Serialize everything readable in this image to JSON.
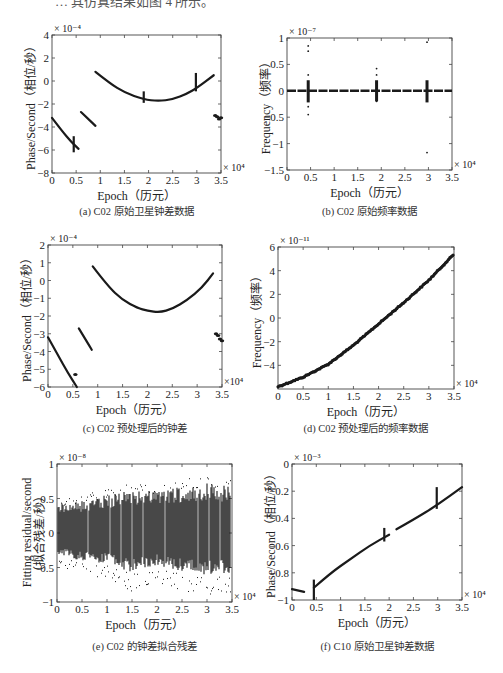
{
  "page": {
    "top_cut_text": "… 其仿真结果如图 4 所示。"
  },
  "panels": [
    {
      "id": "a",
      "caption": "(a) C02 原始卫星钟差数据",
      "xlabel": "Epoch（历元）",
      "ylabel": "Phase/Second（相位/秒）",
      "y_exponent": "× 10⁻⁴",
      "x_exponent": "× 10⁴"
    },
    {
      "id": "b",
      "caption": "(b) C02 原始频率数据",
      "xlabel": "Epoch（历元）",
      "ylabel": "Frequency（频率）",
      "y_exponent": "× 10⁻⁷",
      "x_exponent": "× 10⁴"
    },
    {
      "id": "c",
      "caption": "(c) C02 预处理后的钟差",
      "xlabel": "Epoch（历元）",
      "ylabel": "Phase/Second（相位/秒）",
      "y_exponent": "× 10⁻⁴",
      "x_exponent": "×10⁴"
    },
    {
      "id": "d",
      "caption": "(d) C02 预处理后的频率数据",
      "xlabel": "Epoch（历元）",
      "ylabel": "Frequency（频率）",
      "y_exponent": "× 10⁻¹¹",
      "x_exponent": "× 10⁴"
    },
    {
      "id": "e",
      "caption": "(e) C02 的钟差拟合残差",
      "xlabel": "Epoch（历元）",
      "ylabel": "Fitting residual/second",
      "ylabel2": "（拟合残差/秒）",
      "y_exponent": "× 10⁻⁸",
      "x_exponent": "× 10⁴"
    },
    {
      "id": "f",
      "caption": "(f) C10 原始卫星钟差数据",
      "xlabel": "Epoch（历元）",
      "ylabel": "Phase/Second（相位/秒）",
      "y_exponent": "× 10⁻³",
      "x_exponent": "× 10⁴"
    }
  ],
  "chart_data": [
    {
      "id": "a",
      "type": "scatter",
      "title": "(a) C02 原始卫星钟差数据",
      "xlabel": "Epoch（历元）",
      "ylabel": "Phase/Second（相位/秒）",
      "x_scale": "× 10^4",
      "y_scale": "× 10^-4",
      "xlim": [
        0,
        3.5
      ],
      "ylim": [
        -8,
        4
      ],
      "xticks": [
        "0",
        "0.5",
        "1",
        "1.5",
        "2",
        "2.5",
        "3",
        "3.5"
      ],
      "yticks": [
        "-8",
        "-6",
        "-4",
        "-2",
        "0",
        "2",
        "4"
      ],
      "grid": false,
      "legend": null,
      "series": [
        {
          "name": "segment1",
          "x": [
            0,
            0.2,
            0.4,
            0.55
          ],
          "y": [
            -3.2,
            -4.3,
            -5.3,
            -5.9
          ]
        },
        {
          "name": "segment2",
          "x": [
            0.6,
            0.75,
            0.9
          ],
          "y": [
            -2.7,
            -3.3,
            -3.9
          ]
        },
        {
          "name": "segment3",
          "x": [
            0.9,
            1.2,
            1.5,
            1.9,
            2.2,
            2.5,
            2.8,
            3.0,
            3.35
          ],
          "y": [
            0.8,
            -0.2,
            -1.0,
            -1.6,
            -1.75,
            -1.6,
            -1.1,
            -0.6,
            0.5
          ]
        },
        {
          "name": "jump_0.45",
          "x": [
            0.45,
            0.45
          ],
          "y": [
            -4.8,
            -6.2
          ]
        },
        {
          "name": "jump_1.9",
          "x": [
            1.9,
            1.9
          ],
          "y": [
            -0.9,
            -1.9
          ]
        },
        {
          "name": "jump_3.0",
          "x": [
            2.98,
            2.98
          ],
          "y": [
            0.7,
            -0.9
          ]
        },
        {
          "name": "cluster_3.4",
          "x": [
            3.38,
            3.42,
            3.46,
            3.5
          ],
          "y": [
            -3.0,
            -3.1,
            -3.3,
            -3.2
          ]
        }
      ]
    },
    {
      "id": "b",
      "type": "scatter",
      "title": "(b) C02 原始频率数据",
      "xlabel": "Epoch（历元）",
      "ylabel": "Frequency（频率）",
      "x_scale": "× 10^4",
      "y_scale": "× 10^-7",
      "xlim": [
        0,
        3.5
      ],
      "ylim": [
        -1.5,
        1
      ],
      "xticks": [
        "0",
        "0.5",
        "1",
        "1.5",
        "2",
        "2.5",
        "3",
        "3.5"
      ],
      "yticks": [
        "-1.5",
        "-1",
        "-0.5",
        "0",
        "0.5",
        "1"
      ],
      "grid": false,
      "legend": null,
      "series": [
        {
          "name": "baseline",
          "x": [
            0,
            3.5
          ],
          "y": [
            0,
            0
          ]
        },
        {
          "name": "spikes_0.45",
          "x": [
            0.45,
            0.45,
            0.45,
            0.45,
            0.45
          ],
          "y": [
            0.85,
            0.75,
            0.3,
            -0.3,
            -0.45
          ]
        },
        {
          "name": "spikes_1.9",
          "x": [
            1.9,
            1.9,
            1.9,
            1.9
          ],
          "y": [
            0.42,
            0.3,
            0.15,
            -0.2
          ]
        },
        {
          "name": "spikes_2.97",
          "x": [
            2.97,
            2.97,
            2.97
          ],
          "y": [
            0.92,
            0.15,
            -1.17
          ]
        }
      ]
    },
    {
      "id": "c",
      "type": "scatter",
      "title": "(c) C02 预处理后的钟差",
      "xlabel": "Epoch（历元）",
      "ylabel": "Phase/Second（相位/秒）",
      "x_scale": "× 10^4",
      "y_scale": "× 10^-4",
      "xlim": [
        0,
        3.5
      ],
      "ylim": [
        -6,
        2
      ],
      "xticks": [
        "0",
        "0.5",
        "1",
        "1.5",
        "2",
        "2.5",
        "3",
        "3.5"
      ],
      "yticks": [
        "-6",
        "-5",
        "-4",
        "-3",
        "-2",
        "-1",
        "0",
        "1",
        "2"
      ],
      "grid": false,
      "legend": null,
      "series": [
        {
          "name": "segment1",
          "x": [
            0,
            0.2,
            0.4,
            0.58
          ],
          "y": [
            -3.2,
            -4.2,
            -5.2,
            -6.0
          ]
        },
        {
          "name": "dot",
          "x": [
            0.55
          ],
          "y": [
            -5.3
          ]
        },
        {
          "name": "segment2",
          "x": [
            0.62,
            0.75,
            0.88
          ],
          "y": [
            -2.7,
            -3.3,
            -3.9
          ]
        },
        {
          "name": "segment3",
          "x": [
            0.9,
            1.2,
            1.5,
            1.8,
            2.0,
            2.25,
            2.5,
            2.8,
            3.1,
            3.32
          ],
          "y": [
            0.8,
            -0.3,
            -1.1,
            -1.55,
            -1.7,
            -1.8,
            -1.6,
            -1.1,
            -0.4,
            0.4
          ]
        },
        {
          "name": "cluster_3.4",
          "x": [
            3.38,
            3.42,
            3.46,
            3.5
          ],
          "y": [
            -3.0,
            -3.1,
            -3.3,
            -3.4
          ]
        }
      ]
    },
    {
      "id": "d",
      "type": "line",
      "title": "(d) C02 预处理后的频率数据",
      "xlabel": "Epoch（历元）",
      "ylabel": "Frequency（频率）",
      "x_scale": "× 10^4",
      "y_scale": "× 10^-11",
      "xlim": [
        0,
        3.5
      ],
      "ylim": [
        -6,
        6
      ],
      "xticks": [
        "0",
        "0.5",
        "1",
        "1.5",
        "2",
        "2.5",
        "3",
        "3.5"
      ],
      "yticks": [
        "-4",
        "-2",
        "0",
        "2",
        "4",
        "6"
      ],
      "grid": false,
      "legend": null,
      "x": [
        0,
        0.5,
        1.0,
        1.5,
        2.0,
        2.5,
        3.0,
        3.5
      ],
      "y": [
        -5.8,
        -5.0,
        -3.9,
        -2.3,
        -0.5,
        1.3,
        3.2,
        5.4
      ]
    },
    {
      "id": "e",
      "type": "scatter",
      "title": "(e) C02 的钟差拟合残差",
      "xlabel": "Epoch（历元）",
      "ylabel": "Fitting residual/second（拟合残差/秒）",
      "x_scale": "× 10^4",
      "y_scale": "× 10^-8",
      "xlim": [
        0,
        3.5
      ],
      "ylim": [
        -1,
        1
      ],
      "xticks": [
        "0",
        "0.5",
        "1",
        "1.5",
        "2",
        "2.5",
        "3",
        "3.5"
      ],
      "yticks": [
        "-1",
        "-0.5",
        "0",
        "0.5",
        "1"
      ],
      "grid": false,
      "legend": null,
      "description": "Dense noise band centered on 0, envelope roughly ±0.5 growing to ±0.8 toward x=3.5",
      "envelope": {
        "x": [
          0,
          0.5,
          1.0,
          1.5,
          2.0,
          2.5,
          3.0,
          3.5
        ],
        "upper": [
          0.5,
          0.55,
          0.65,
          0.75,
          0.7,
          0.8,
          0.85,
          0.8
        ],
        "lower": [
          -0.45,
          -0.6,
          -0.65,
          -0.85,
          -0.7,
          -0.85,
          -0.9,
          -0.85
        ]
      }
    },
    {
      "id": "f",
      "type": "scatter",
      "title": "(f) C10 原始卫星钟差数据",
      "xlabel": "Epoch（历元）",
      "ylabel": "Phase/Second（相位/秒）",
      "x_scale": "× 10^4",
      "y_scale": "× 10^-3",
      "xlim": [
        0,
        3.5
      ],
      "ylim": [
        -1,
        0
      ],
      "xticks": [
        "0",
        "0.5",
        "1",
        "1.5",
        "2",
        "2.5",
        "3",
        "3.5"
      ],
      "yticks": [
        "-1",
        "-0.8",
        "-0.6",
        "-0.4",
        "-0.2",
        "0"
      ],
      "grid": false,
      "legend": null,
      "series": [
        {
          "name": "segment0",
          "x": [
            0,
            0.25
          ],
          "y": [
            -0.92,
            -0.94
          ]
        },
        {
          "name": "segment1",
          "x": [
            0.45,
            0.8,
            1.2,
            1.6,
            2.0
          ],
          "y": [
            -0.91,
            -0.8,
            -0.7,
            -0.6,
            -0.52
          ]
        },
        {
          "name": "segment2",
          "x": [
            2.15,
            2.5,
            3.0,
            3.5
          ],
          "y": [
            -0.48,
            -0.41,
            -0.3,
            -0.17
          ]
        },
        {
          "name": "jump_0.45",
          "x": [
            0.45,
            0.45
          ],
          "y": [
            -0.85,
            -1.0
          ]
        },
        {
          "name": "jump_1.9",
          "x": [
            1.9,
            1.9
          ],
          "y": [
            -0.47,
            -0.57
          ]
        },
        {
          "name": "jump_3.0",
          "x": [
            2.98,
            2.98
          ],
          "y": [
            -0.17,
            -0.33
          ]
        }
      ]
    }
  ]
}
